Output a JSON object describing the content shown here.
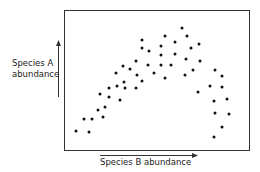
{
  "chart_data": {
    "type": "scatter",
    "title": "",
    "xlabel": "Species B abundance",
    "ylabel": "Species A abundance",
    "ylabel_lines": [
      "Species A",
      "abundance"
    ],
    "axis_ticks": "none",
    "grid": false,
    "legend": null,
    "xlim": [
      0,
      100
    ],
    "ylim": [
      0,
      100
    ],
    "units": "relative position within plot frame (no numeric axes shown)",
    "points": [
      {
        "x": 5.9,
        "y": 13.6
      },
      {
        "x": 13.0,
        "y": 12.9
      },
      {
        "x": 10.3,
        "y": 22.1
      },
      {
        "x": 14.6,
        "y": 22.1
      },
      {
        "x": 17.8,
        "y": 28.6
      },
      {
        "x": 20.5,
        "y": 23.6
      },
      {
        "x": 21.6,
        "y": 30.7
      },
      {
        "x": 18.9,
        "y": 40.0
      },
      {
        "x": 23.8,
        "y": 44.3
      },
      {
        "x": 23.8,
        "y": 37.9
      },
      {
        "x": 28.1,
        "y": 45.7
      },
      {
        "x": 32.4,
        "y": 44.3
      },
      {
        "x": 38.4,
        "y": 44.3
      },
      {
        "x": 29.7,
        "y": 35.7
      },
      {
        "x": 27.6,
        "y": 55.7
      },
      {
        "x": 31.4,
        "y": 60.7
      },
      {
        "x": 35.1,
        "y": 58.6
      },
      {
        "x": 31.9,
        "y": 48.6
      },
      {
        "x": 38.9,
        "y": 54.3
      },
      {
        "x": 41.6,
        "y": 49.3
      },
      {
        "x": 41.6,
        "y": 79.3
      },
      {
        "x": 41.6,
        "y": 73.6
      },
      {
        "x": 38.8,
        "y": 64.3
      },
      {
        "x": 44.9,
        "y": 61.4
      },
      {
        "x": 45.4,
        "y": 71.4
      },
      {
        "x": 48.1,
        "y": 55.7
      },
      {
        "x": 52.4,
        "y": 75.0
      },
      {
        "x": 52.4,
        "y": 68.6
      },
      {
        "x": 52.4,
        "y": 61.4
      },
      {
        "x": 54.1,
        "y": 82.1
      },
      {
        "x": 54.6,
        "y": 52.1
      },
      {
        "x": 57.8,
        "y": 61.4
      },
      {
        "x": 60.0,
        "y": 77.9
      },
      {
        "x": 60.0,
        "y": 69.3
      },
      {
        "x": 63.8,
        "y": 87.9
      },
      {
        "x": 66.5,
        "y": 82.1
      },
      {
        "x": 65.9,
        "y": 65.7
      },
      {
        "x": 65.4,
        "y": 54.3
      },
      {
        "x": 68.6,
        "y": 73.6
      },
      {
        "x": 73.0,
        "y": 76.4
      },
      {
        "x": 73.5,
        "y": 64.3
      },
      {
        "x": 69.7,
        "y": 57.9
      },
      {
        "x": 72.4,
        "y": 41.4
      },
      {
        "x": 78.9,
        "y": 46.4
      },
      {
        "x": 81.6,
        "y": 57.9
      },
      {
        "x": 85.4,
        "y": 52.9
      },
      {
        "x": 85.4,
        "y": 45.0
      },
      {
        "x": 81.1,
        "y": 35.0
      },
      {
        "x": 88.1,
        "y": 36.4
      },
      {
        "x": 81.6,
        "y": 26.4
      },
      {
        "x": 89.2,
        "y": 25.7
      },
      {
        "x": 85.4,
        "y": 16.4
      },
      {
        "x": 81.1,
        "y": 9.3
      }
    ],
    "point_color": "#111111",
    "frame_color": "#333333"
  },
  "labels": {
    "y_line1": "Species A",
    "y_line2": "abundance",
    "x": "Species B abundance"
  }
}
